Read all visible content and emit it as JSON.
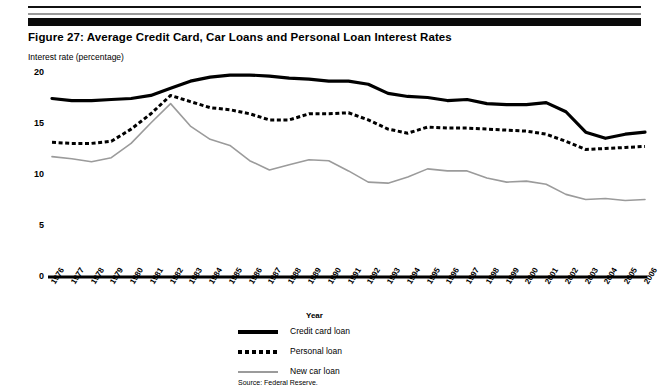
{
  "figure": {
    "title": "Figure 27:  Average Credit Card, Car Loans and Personal Loan Interest Rates",
    "axis_note": "Interest rate (percentage)",
    "source": "Source: Federal Reserve."
  },
  "legend": {
    "position": "below-chart",
    "items": [
      {
        "label": "Credit card loan",
        "style": "solid-thick",
        "color": "#000000"
      },
      {
        "label": "Personal loan",
        "style": "dotted",
        "color": "#000000"
      },
      {
        "label": "New car loan",
        "style": "solid-gray",
        "color": "#9b9b9b"
      }
    ]
  },
  "chart_data": {
    "type": "line",
    "title": "Figure 27:  Average Credit Card, Car Loans and Personal Loan Interest Rates",
    "subtitle": "Interest rate (percentage)",
    "xlabel": "Year",
    "ylabel": "Interest rate (percentage)",
    "ylim": [
      0,
      20
    ],
    "yticks": [
      0,
      5,
      10,
      15,
      20
    ],
    "ytick_labels": [
      "0",
      "5",
      "10",
      "15",
      "20"
    ],
    "grid": false,
    "legend_position": "below",
    "annotation": "Source: Federal Reserve.",
    "categories": [
      "1976",
      "1977",
      "1978",
      "1979",
      "1980",
      "1981",
      "1982",
      "1983",
      "1984",
      "1985",
      "1986",
      "1987",
      "1988",
      "1989",
      "1990",
      "1991",
      "1992",
      "1993",
      "1994",
      "1995",
      "1996",
      "1997",
      "1998",
      "1999",
      "2000",
      "2001",
      "2002",
      "2003",
      "2004",
      "2005",
      "2006"
    ],
    "series": [
      {
        "name": "Credit card loan",
        "color": "#000000",
        "style": "solid-thick",
        "values": [
          17.5,
          17.3,
          17.3,
          17.4,
          17.5,
          17.8,
          18.5,
          19.2,
          19.6,
          19.8,
          19.8,
          19.7,
          19.5,
          19.4,
          19.2,
          19.2,
          18.9,
          18.0,
          17.7,
          17.6,
          17.3,
          17.4,
          17.0,
          16.9,
          16.9,
          17.1,
          16.2,
          14.2,
          13.6,
          14.0,
          14.2
        ]
      },
      {
        "name": "Personal loan",
        "color": "#000000",
        "style": "dotted",
        "values": [
          13.2,
          13.1,
          13.1,
          13.3,
          14.5,
          16.0,
          17.8,
          17.2,
          16.6,
          16.4,
          16.0,
          15.4,
          15.4,
          16.0,
          16.0,
          16.1,
          15.4,
          14.5,
          14.1,
          14.7,
          14.6,
          14.6,
          14.5,
          14.4,
          14.3,
          14.0,
          13.3,
          12.5,
          12.6,
          12.7,
          12.8
        ]
      },
      {
        "name": "New car loan",
        "color": "#9b9b9b",
        "style": "solid-gray",
        "values": [
          11.8,
          11.6,
          11.3,
          11.7,
          13.1,
          15.1,
          17.0,
          14.8,
          13.5,
          12.9,
          11.4,
          10.5,
          11.0,
          11.5,
          11.4,
          10.4,
          9.3,
          9.2,
          9.8,
          10.6,
          10.4,
          10.4,
          9.7,
          9.3,
          9.4,
          9.1,
          8.1,
          7.6,
          7.7,
          7.5,
          7.6
        ]
      }
    ]
  }
}
